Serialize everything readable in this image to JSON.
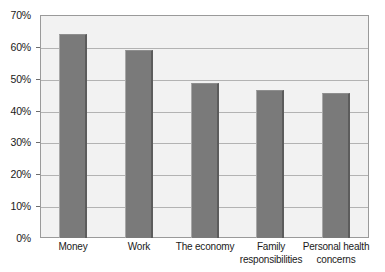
{
  "chart_data": {
    "type": "bar",
    "title": "",
    "subtitle": "",
    "xlabel": "",
    "ylabel": "",
    "categories": [
      "Money",
      "Work",
      "The economy",
      "Family responsibilities",
      "Personal health concerns"
    ],
    "category_lines": [
      [
        "Money"
      ],
      [
        "Work"
      ],
      [
        "The economy"
      ],
      [
        "Family",
        "responsibilities"
      ],
      [
        "Personal health",
        "concerns"
      ]
    ],
    "values": [
      64,
      59,
      48.5,
      46.5,
      45.5
    ],
    "value_labels": [
      "64%",
      "59%",
      "48.5%",
      "46.5%",
      "45.5%"
    ],
    "ylim": [
      0,
      70
    ],
    "ytick_values": [
      0,
      10,
      20,
      30,
      40,
      50,
      60,
      70
    ],
    "ytick_labels": [
      "0%",
      "10%",
      "20%",
      "30%",
      "40%",
      "50%",
      "60%",
      "70%"
    ],
    "grid": true,
    "grid_axis": "y",
    "legend": false,
    "legend_position": "none",
    "colors": {
      "bar_fill": "#7a7a7a",
      "bar_edge_dark": "#5c5c5c",
      "bar_edge_light": "#a8a8a8",
      "plot_background": "#f2f2f2",
      "plot_border": "#9a9a9a",
      "gridline": "#b3b3b3",
      "text": "#1a1a1a",
      "page_background": "#ffffff"
    }
  }
}
